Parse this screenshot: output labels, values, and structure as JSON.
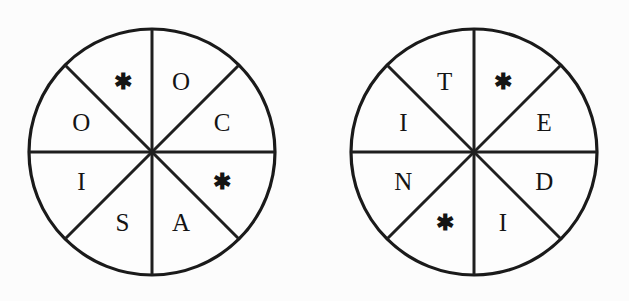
{
  "figure": {
    "kind": "word-wheel-pair",
    "background_color": "#fcfcfc",
    "ink_color": "#1a1a1a",
    "star_glyph": "✱",
    "sector_count": 8,
    "sector_degrees": 45
  },
  "wheels": [
    {
      "id": "left-wheel",
      "name": "left-word-wheel",
      "center_x": 152,
      "center_y": 152,
      "radius": 123,
      "sectors": [
        {
          "position": "north-northeast",
          "angle_deg": 22.5,
          "value": "O",
          "is_star": false
        },
        {
          "position": "east-northeast",
          "angle_deg": 67.5,
          "value": "C",
          "is_star": false
        },
        {
          "position": "east-southeast",
          "angle_deg": 112.5,
          "value": "✱",
          "is_star": true
        },
        {
          "position": "south-southeast",
          "angle_deg": 157.5,
          "value": "A",
          "is_star": false
        },
        {
          "position": "south-southwest",
          "angle_deg": 202.5,
          "value": "S",
          "is_star": false
        },
        {
          "position": "west-southwest",
          "angle_deg": 247.5,
          "value": "I",
          "is_star": false
        },
        {
          "position": "west-northwest",
          "angle_deg": 292.5,
          "value": "O",
          "is_star": false
        },
        {
          "position": "north-northwest",
          "angle_deg": 337.5,
          "value": "✱",
          "is_star": true
        }
      ]
    },
    {
      "id": "right-wheel",
      "name": "right-word-wheel",
      "center_x": 474,
      "center_y": 152,
      "radius": 123,
      "sectors": [
        {
          "position": "north-northeast",
          "angle_deg": 22.5,
          "value": "✱",
          "is_star": true
        },
        {
          "position": "east-northeast",
          "angle_deg": 67.5,
          "value": "E",
          "is_star": false
        },
        {
          "position": "east-southeast",
          "angle_deg": 112.5,
          "value": "D",
          "is_star": false
        },
        {
          "position": "south-southeast",
          "angle_deg": 157.5,
          "value": "I",
          "is_star": false
        },
        {
          "position": "south-southwest",
          "angle_deg": 202.5,
          "value": "✱",
          "is_star": true
        },
        {
          "position": "west-southwest",
          "angle_deg": 247.5,
          "value": "N",
          "is_star": false
        },
        {
          "position": "west-northwest",
          "angle_deg": 292.5,
          "value": "I",
          "is_star": false
        },
        {
          "position": "north-northwest",
          "angle_deg": 337.5,
          "value": "T",
          "is_star": false
        }
      ]
    }
  ]
}
